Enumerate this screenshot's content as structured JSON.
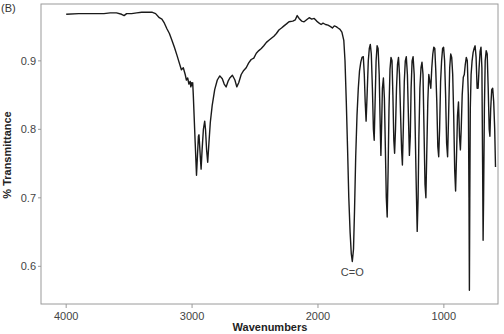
{
  "chart_data": {
    "type": "line",
    "panel_label": "(B)",
    "title": "",
    "xlabel": "Wavenumbers",
    "ylabel": "% Transmittance",
    "xlim": [
      4200,
      570
    ],
    "ylim": [
      0.545,
      0.983
    ],
    "x_reversed": true,
    "grid": false,
    "legend": "none",
    "xticks": [
      4000,
      3000,
      2000,
      1000
    ],
    "xtick_labels": [
      "4000",
      "3000",
      "2000",
      "1000"
    ],
    "yticks": [
      0.6,
      0.7,
      0.8,
      0.9
    ],
    "ytick_labels": [
      "0.6",
      "0.7",
      "0.8",
      "0.9"
    ],
    "annotations": [
      {
        "text": "C=O",
        "x": 1727,
        "y": 0.607
      }
    ],
    "series": [
      {
        "name": "IR spectrum",
        "color": "#1a1a1a",
        "points": [
          [
            4000,
            0.968
          ],
          [
            3900,
            0.969
          ],
          [
            3800,
            0.969
          ],
          [
            3700,
            0.969
          ],
          [
            3650,
            0.97
          ],
          [
            3600,
            0.97
          ],
          [
            3560,
            0.968
          ],
          [
            3540,
            0.966
          ],
          [
            3520,
            0.969
          ],
          [
            3480,
            0.969
          ],
          [
            3440,
            0.97
          ],
          [
            3400,
            0.971
          ],
          [
            3360,
            0.971
          ],
          [
            3320,
            0.971
          ],
          [
            3290,
            0.969
          ],
          [
            3260,
            0.963
          ],
          [
            3240,
            0.961
          ],
          [
            3220,
            0.955
          ],
          [
            3200,
            0.947
          ],
          [
            3180,
            0.94
          ],
          [
            3160,
            0.93
          ],
          [
            3140,
            0.92
          ],
          [
            3120,
            0.908
          ],
          [
            3100,
            0.896
          ],
          [
            3085,
            0.887
          ],
          [
            3070,
            0.89
          ],
          [
            3055,
            0.88
          ],
          [
            3045,
            0.872
          ],
          [
            3035,
            0.875
          ],
          [
            3025,
            0.866
          ],
          [
            3015,
            0.87
          ],
          [
            3010,
            0.862
          ],
          [
            3005,
            0.868
          ],
          [
            3000,
            0.864
          ],
          [
            2995,
            0.868
          ],
          [
            2990,
            0.85
          ],
          [
            2975,
            0.78
          ],
          [
            2965,
            0.733
          ],
          [
            2958,
            0.76
          ],
          [
            2950,
            0.79
          ],
          [
            2945,
            0.792
          ],
          [
            2935,
            0.76
          ],
          [
            2928,
            0.742
          ],
          [
            2920,
            0.77
          ],
          [
            2910,
            0.8
          ],
          [
            2900,
            0.812
          ],
          [
            2893,
            0.8
          ],
          [
            2885,
            0.77
          ],
          [
            2876,
            0.752
          ],
          [
            2868,
            0.775
          ],
          [
            2855,
            0.81
          ],
          [
            2840,
            0.835
          ],
          [
            2820,
            0.858
          ],
          [
            2800,
            0.872
          ],
          [
            2780,
            0.878
          ],
          [
            2760,
            0.874
          ],
          [
            2745,
            0.866
          ],
          [
            2730,
            0.862
          ],
          [
            2715,
            0.87
          ],
          [
            2700,
            0.875
          ],
          [
            2680,
            0.879
          ],
          [
            2660,
            0.872
          ],
          [
            2645,
            0.862
          ],
          [
            2630,
            0.868
          ],
          [
            2610,
            0.88
          ],
          [
            2590,
            0.886
          ],
          [
            2570,
            0.89
          ],
          [
            2550,
            0.897
          ],
          [
            2530,
            0.902
          ],
          [
            2510,
            0.904
          ],
          [
            2490,
            0.911
          ],
          [
            2470,
            0.915
          ],
          [
            2450,
            0.918
          ],
          [
            2430,
            0.922
          ],
          [
            2410,
            0.927
          ],
          [
            2390,
            0.93
          ],
          [
            2370,
            0.933
          ],
          [
            2350,
            0.936
          ],
          [
            2330,
            0.94
          ],
          [
            2310,
            0.945
          ],
          [
            2290,
            0.948
          ],
          [
            2270,
            0.951
          ],
          [
            2250,
            0.954
          ],
          [
            2230,
            0.957
          ],
          [
            2200,
            0.958
          ],
          [
            2180,
            0.96
          ],
          [
            2165,
            0.966
          ],
          [
            2150,
            0.962
          ],
          [
            2130,
            0.958
          ],
          [
            2110,
            0.957
          ],
          [
            2090,
            0.96
          ],
          [
            2070,
            0.963
          ],
          [
            2050,
            0.961
          ],
          [
            2030,
            0.962
          ],
          [
            2010,
            0.958
          ],
          [
            1990,
            0.955
          ],
          [
            1975,
            0.953
          ],
          [
            1960,
            0.955
          ],
          [
            1940,
            0.953
          ],
          [
            1920,
            0.952
          ],
          [
            1900,
            0.95
          ],
          [
            1885,
            0.948
          ],
          [
            1870,
            0.951
          ],
          [
            1855,
            0.95
          ],
          [
            1840,
            0.948
          ],
          [
            1825,
            0.946
          ],
          [
            1810,
            0.942
          ],
          [
            1795,
            0.93
          ],
          [
            1785,
            0.9
          ],
          [
            1775,
            0.84
          ],
          [
            1765,
            0.77
          ],
          [
            1755,
            0.7
          ],
          [
            1745,
            0.65
          ],
          [
            1735,
            0.618
          ],
          [
            1727,
            0.607
          ],
          [
            1718,
            0.625
          ],
          [
            1710,
            0.68
          ],
          [
            1700,
            0.76
          ],
          [
            1690,
            0.82
          ],
          [
            1680,
            0.86
          ],
          [
            1670,
            0.885
          ],
          [
            1660,
            0.898
          ],
          [
            1650,
            0.905
          ],
          [
            1640,
            0.906
          ],
          [
            1632,
            0.88
          ],
          [
            1625,
            0.84
          ],
          [
            1618,
            0.812
          ],
          [
            1610,
            0.85
          ],
          [
            1600,
            0.9
          ],
          [
            1592,
            0.918
          ],
          [
            1584,
            0.924
          ],
          [
            1576,
            0.91
          ],
          [
            1568,
            0.86
          ],
          [
            1560,
            0.8
          ],
          [
            1553,
            0.784
          ],
          [
            1546,
            0.84
          ],
          [
            1538,
            0.9
          ],
          [
            1530,
            0.922
          ],
          [
            1522,
            0.918
          ],
          [
            1514,
            0.88
          ],
          [
            1507,
            0.82
          ],
          [
            1500,
            0.762
          ],
          [
            1494,
            0.81
          ],
          [
            1488,
            0.86
          ],
          [
            1480,
            0.875
          ],
          [
            1472,
            0.845
          ],
          [
            1464,
            0.77
          ],
          [
            1457,
            0.7
          ],
          [
            1450,
            0.672
          ],
          [
            1443,
            0.74
          ],
          [
            1436,
            0.83
          ],
          [
            1428,
            0.888
          ],
          [
            1420,
            0.905
          ],
          [
            1412,
            0.9
          ],
          [
            1405,
            0.85
          ],
          [
            1398,
            0.785
          ],
          [
            1391,
            0.765
          ],
          [
            1384,
            0.8
          ],
          [
            1376,
            0.86
          ],
          [
            1368,
            0.895
          ],
          [
            1360,
            0.905
          ],
          [
            1352,
            0.88
          ],
          [
            1344,
            0.82
          ],
          [
            1336,
            0.77
          ],
          [
            1329,
            0.748
          ],
          [
            1322,
            0.8
          ],
          [
            1314,
            0.87
          ],
          [
            1306,
            0.9
          ],
          [
            1298,
            0.906
          ],
          [
            1290,
            0.88
          ],
          [
            1282,
            0.82
          ],
          [
            1274,
            0.762
          ],
          [
            1267,
            0.79
          ],
          [
            1260,
            0.86
          ],
          [
            1252,
            0.9
          ],
          [
            1244,
            0.906
          ],
          [
            1236,
            0.88
          ],
          [
            1228,
            0.8
          ],
          [
            1220,
            0.72
          ],
          [
            1212,
            0.651
          ],
          [
            1205,
            0.7
          ],
          [
            1198,
            0.79
          ],
          [
            1190,
            0.86
          ],
          [
            1182,
            0.89
          ],
          [
            1174,
            0.898
          ],
          [
            1166,
            0.88
          ],
          [
            1158,
            0.8
          ],
          [
            1150,
            0.72
          ],
          [
            1143,
            0.7
          ],
          [
            1136,
            0.76
          ],
          [
            1128,
            0.84
          ],
          [
            1120,
            0.88
          ],
          [
            1112,
            0.87
          ],
          [
            1104,
            0.86
          ],
          [
            1096,
            0.89
          ],
          [
            1088,
            0.91
          ],
          [
            1080,
            0.92
          ],
          [
            1072,
            0.918
          ],
          [
            1064,
            0.885
          ],
          [
            1056,
            0.84
          ],
          [
            1048,
            0.775
          ],
          [
            1041,
            0.76
          ],
          [
            1034,
            0.8
          ],
          [
            1026,
            0.87
          ],
          [
            1018,
            0.9
          ],
          [
            1010,
            0.918
          ],
          [
            1002,
            0.92
          ],
          [
            994,
            0.9
          ],
          [
            986,
            0.85
          ],
          [
            978,
            0.78
          ],
          [
            970,
            0.76
          ],
          [
            962,
            0.82
          ],
          [
            954,
            0.89
          ],
          [
            946,
            0.91
          ],
          [
            938,
            0.905
          ],
          [
            930,
            0.88
          ],
          [
            922,
            0.82
          ],
          [
            914,
            0.74
          ],
          [
            907,
            0.71
          ],
          [
            900,
            0.76
          ],
          [
            892,
            0.82
          ],
          [
            884,
            0.84
          ],
          [
            876,
            0.79
          ],
          [
            869,
            0.77
          ],
          [
            862,
            0.8
          ],
          [
            854,
            0.85
          ],
          [
            846,
            0.876
          ],
          [
            838,
            0.88
          ],
          [
            830,
            0.895
          ],
          [
            822,
            0.905
          ],
          [
            814,
            0.9
          ],
          [
            806,
            0.85
          ],
          [
            800,
            0.7
          ],
          [
            797,
            0.565
          ],
          [
            794,
            0.7
          ],
          [
            790,
            0.83
          ],
          [
            784,
            0.88
          ],
          [
            776,
            0.9
          ],
          [
            768,
            0.912
          ],
          [
            760,
            0.918
          ],
          [
            752,
            0.922
          ],
          [
            744,
            0.905
          ],
          [
            736,
            0.86
          ],
          [
            728,
            0.86
          ],
          [
            720,
            0.89
          ],
          [
            712,
            0.914
          ],
          [
            705,
            0.92
          ],
          [
            698,
            0.89
          ],
          [
            692,
            0.75
          ],
          [
            688,
            0.638
          ],
          [
            684,
            0.7
          ],
          [
            678,
            0.83
          ],
          [
            672,
            0.9
          ],
          [
            664,
            0.915
          ],
          [
            656,
            0.91
          ],
          [
            648,
            0.86
          ],
          [
            640,
            0.8
          ],
          [
            634,
            0.79
          ],
          [
            628,
            0.83
          ],
          [
            620,
            0.858
          ],
          [
            612,
            0.86
          ],
          [
            604,
            0.84
          ],
          [
            596,
            0.8
          ],
          [
            590,
            0.745
          ]
        ]
      }
    ]
  }
}
